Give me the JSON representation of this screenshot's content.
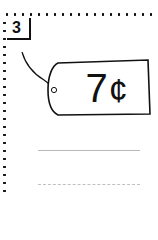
{
  "problem": {
    "number": "3",
    "price_tag": {
      "amount": "7",
      "unit": "¢"
    },
    "answer_lines": [
      {
        "style": "solid"
      },
      {
        "style": "dashed"
      }
    ]
  },
  "colors": {
    "ink": "#111111",
    "line": "#b8b8b8"
  }
}
